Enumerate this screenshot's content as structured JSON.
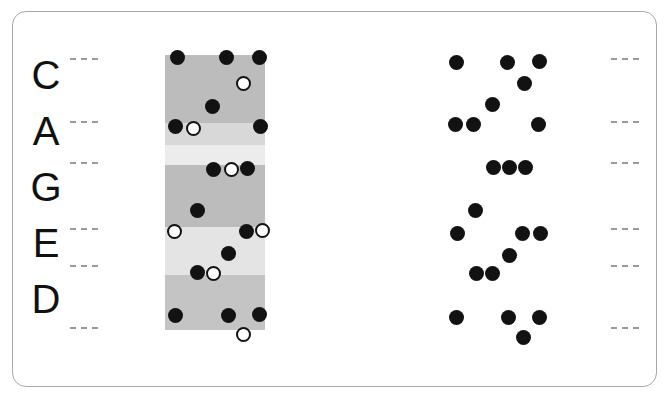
{
  "diagram": {
    "frame": {
      "border_color": "#a8a8a8",
      "background": "#ffffff"
    }
  },
  "letters": {
    "name": "caged-letters",
    "items": [
      {
        "label": "C",
        "top": 0
      },
      {
        "label": "A",
        "top": 56
      },
      {
        "label": "G",
        "top": 112
      },
      {
        "label": "E",
        "top": 168
      },
      {
        "label": "D",
        "top": 224
      }
    ]
  },
  "ticks": {
    "name": "fret-markers",
    "color": "#9a9a9a",
    "left_y": [
      58,
      121,
      162,
      228,
      265,
      327
    ],
    "right_y": [
      58,
      121,
      162,
      228,
      265,
      327
    ]
  },
  "fretboard": {
    "name": "fretboard-bands",
    "left": 165,
    "top": 55,
    "width": 100,
    "height": 275,
    "colors": {
      "dark": "#bcbcbc",
      "light": "#dcdcdc",
      "lighter": "#eaeaea"
    },
    "bands": [
      {
        "top": 0,
        "height": 68,
        "color": "#bcbcbc"
      },
      {
        "top": 68,
        "height": 22,
        "color": "#d8d8d8"
      },
      {
        "top": 90,
        "height": 20,
        "color": "#ececec"
      },
      {
        "top": 110,
        "height": 62,
        "color": "#bcbcbc"
      },
      {
        "top": 172,
        "height": 48,
        "color": "#e4e4e4"
      },
      {
        "top": 220,
        "height": 55,
        "color": "#c4c4c4"
      }
    ],
    "dot_colors": {
      "filled": "#121212",
      "open_fill": "#ffffff",
      "open_stroke": "#121212"
    },
    "dots": [
      {
        "x": 170,
        "y": 50,
        "type": "filled"
      },
      {
        "x": 219,
        "y": 50,
        "type": "filled"
      },
      {
        "x": 252,
        "y": 50,
        "type": "filled"
      },
      {
        "x": 236,
        "y": 76,
        "type": "open"
      },
      {
        "x": 205,
        "y": 99,
        "type": "filled"
      },
      {
        "x": 168,
        "y": 119,
        "type": "filled"
      },
      {
        "x": 186,
        "y": 121,
        "type": "open"
      },
      {
        "x": 253,
        "y": 119,
        "type": "filled"
      },
      {
        "x": 206,
        "y": 162,
        "type": "filled"
      },
      {
        "x": 224,
        "y": 162,
        "type": "open"
      },
      {
        "x": 240,
        "y": 161,
        "type": "filled"
      },
      {
        "x": 190,
        "y": 203,
        "type": "filled"
      },
      {
        "x": 167,
        "y": 224,
        "type": "open"
      },
      {
        "x": 239,
        "y": 224,
        "type": "filled"
      },
      {
        "x": 255,
        "y": 223,
        "type": "open"
      },
      {
        "x": 221,
        "y": 246,
        "type": "filled"
      },
      {
        "x": 190,
        "y": 265,
        "type": "filled"
      },
      {
        "x": 206,
        "y": 266,
        "type": "open"
      },
      {
        "x": 168,
        "y": 308,
        "type": "filled"
      },
      {
        "x": 221,
        "y": 308,
        "type": "filled"
      },
      {
        "x": 252,
        "y": 307,
        "type": "filled"
      },
      {
        "x": 236,
        "y": 327,
        "type": "open"
      }
    ]
  },
  "shapes": {
    "name": "chord-shape-dots",
    "dot_color": "#121212",
    "dots": [
      {
        "x": 449,
        "y": 55
      },
      {
        "x": 500,
        "y": 55
      },
      {
        "x": 532,
        "y": 54
      },
      {
        "x": 517,
        "y": 76
      },
      {
        "x": 485,
        "y": 97
      },
      {
        "x": 448,
        "y": 117
      },
      {
        "x": 466,
        "y": 117
      },
      {
        "x": 531,
        "y": 117
      },
      {
        "x": 486,
        "y": 160
      },
      {
        "x": 502,
        "y": 160
      },
      {
        "x": 518,
        "y": 160
      },
      {
        "x": 468,
        "y": 203
      },
      {
        "x": 450,
        "y": 226
      },
      {
        "x": 515,
        "y": 226
      },
      {
        "x": 533,
        "y": 226
      },
      {
        "x": 502,
        "y": 248
      },
      {
        "x": 469,
        "y": 266
      },
      {
        "x": 485,
        "y": 266
      },
      {
        "x": 449,
        "y": 310
      },
      {
        "x": 501,
        "y": 310
      },
      {
        "x": 532,
        "y": 310
      },
      {
        "x": 516,
        "y": 330
      }
    ]
  }
}
